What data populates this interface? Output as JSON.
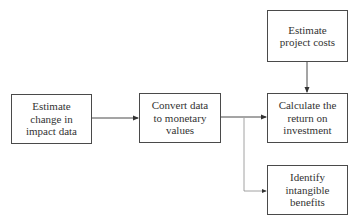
{
  "diagram": {
    "type": "flowchart",
    "nodes": [
      {
        "id": "n1",
        "label": "Estimate\nchange in\nimpact data"
      },
      {
        "id": "n2",
        "label": "Convert data\nto monetary\nvalues"
      },
      {
        "id": "n3",
        "label": "Estimate\nproject costs"
      },
      {
        "id": "n4",
        "label": "Calculate the\nreturn on\ninvestment"
      },
      {
        "id": "n5",
        "label": "Identify\nintangible\nbenefits"
      }
    ],
    "edges": [
      {
        "from": "n1",
        "to": "n2",
        "style": "solid"
      },
      {
        "from": "n2",
        "to": "n4",
        "style": "solid"
      },
      {
        "from": "n3",
        "to": "n4",
        "style": "solid"
      },
      {
        "from": "n2",
        "to": "n5",
        "style": "thin"
      }
    ],
    "colors": {
      "stroke": "#4a4a4a",
      "thin_stroke": "#8a8a8a",
      "text": "#333333",
      "background": "#ffffff"
    }
  }
}
